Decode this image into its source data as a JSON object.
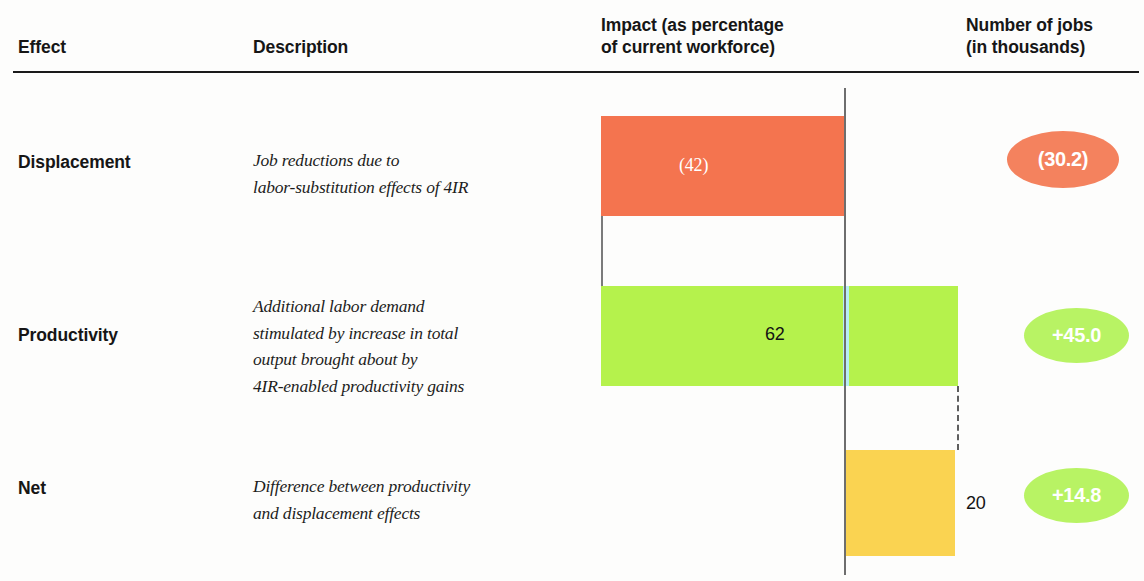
{
  "header": {
    "effect": "Effect",
    "description": "Description",
    "impact": "Impact (as percentage\nof current workforce)",
    "jobs": "Number of jobs\n(in thousands)"
  },
  "rows": [
    {
      "effect": "Displacement",
      "description": "Job reductions due to\nlabor-substitution effects of 4IR",
      "impact_label": "(42)",
      "jobs_label": "(30.2)"
    },
    {
      "effect": "Productivity",
      "description": "Additional labor demand\nstimulated by increase in total\noutput brought about by\n4IR-enabled productivity gains",
      "impact_label": "62",
      "jobs_label": "+45.0"
    },
    {
      "effect": "Net",
      "description": "Difference between productivity\nand displacement effects",
      "impact_label": "20",
      "jobs_label": "+14.8"
    }
  ],
  "chart_data": {
    "type": "bar",
    "title": "Impact (as percentage of current workforce)",
    "xlabel": "Percentage of current workforce",
    "ylabel": "",
    "categories": [
      "Displacement",
      "Productivity",
      "Net"
    ],
    "values": [
      -42,
      62,
      20
    ],
    "value_labels": [
      "(42)",
      "62",
      "20"
    ],
    "jobs_thousands": [
      -30.2,
      45.0,
      14.8
    ],
    "jobs_labels": [
      "(30.2)",
      "+45.0",
      "+14.8"
    ],
    "colors": [
      "#f4744f",
      "#b5f24c",
      "#fad351"
    ],
    "badge_colors": [
      "#f4825e",
      "#b8f364",
      "#b8f364"
    ],
    "waterfall": true,
    "grid": false,
    "legend": "none",
    "axis_zero_label": "0"
  }
}
